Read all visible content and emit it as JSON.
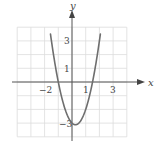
{
  "chart_data": {
    "type": "line",
    "title": "",
    "xlabel": "x",
    "ylabel": "y",
    "xlim": [
      -4,
      4
    ],
    "ylim": [
      -4,
      4
    ],
    "grid": true,
    "x_tick_labels": [
      {
        "value": -2,
        "label": "−2"
      },
      {
        "value": 1,
        "label": "1"
      },
      {
        "value": 3,
        "label": "3"
      }
    ],
    "y_tick_labels": [
      {
        "value": 3,
        "label": "3"
      },
      {
        "value": 1,
        "label": "1"
      },
      {
        "value": -3,
        "label": "−3"
      }
    ],
    "series": [
      {
        "name": "parabola",
        "function": "y = 2x^2 - x - 3",
        "x_range": [
          -1.57,
          2.07
        ],
        "vertex": [
          0.25,
          -3.125
        ],
        "x_intercepts": [
          -1,
          1.5
        ],
        "y_intercept": -3,
        "points": [
          [
            -1.57,
            3.5
          ],
          [
            -1.5,
            3.0
          ],
          [
            -1.0,
            0.0
          ],
          [
            -0.5,
            -2.0
          ],
          [
            0.0,
            -3.0
          ],
          [
            0.25,
            -3.125
          ],
          [
            0.5,
            -3.0
          ],
          [
            1.0,
            -2.0
          ],
          [
            1.5,
            0.0
          ],
          [
            2.0,
            3.0
          ],
          [
            2.07,
            3.5
          ]
        ]
      }
    ],
    "colors": {
      "curve": "#6e6e6e",
      "axes": "#555555",
      "grid": "#d9d9d9"
    }
  },
  "labels": {
    "x_axis": "x",
    "y_axis": "y",
    "tick_x_neg2": "−2",
    "tick_x_1": "1",
    "tick_x_3": "3",
    "tick_y_3": "3",
    "tick_y_1": "1",
    "tick_y_neg3": "−3"
  }
}
